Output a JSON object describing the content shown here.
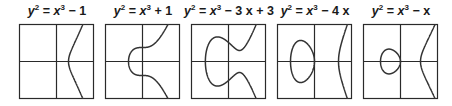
{
  "figure": {
    "panels": [
      {
        "id": "p1",
        "title_lhs": "y",
        "title_lhs_exp": "2",
        "title_eq": " = ",
        "title_x": "x",
        "title_x_exp": "3",
        "title_rest": " − 1",
        "box_left": 19
      },
      {
        "id": "p2",
        "title_lhs": "y",
        "title_lhs_exp": "2",
        "title_eq": " = ",
        "title_x": "x",
        "title_x_exp": "3",
        "title_rest": " + 1",
        "box_left": 105
      },
      {
        "id": "p3",
        "title_lhs": "y",
        "title_lhs_exp": "2",
        "title_eq": " = ",
        "title_x": "x",
        "title_x_exp": "3",
        "title_rest": " − 3 x + 3",
        "box_left": 191
      },
      {
        "id": "p4",
        "title_lhs": "y",
        "title_lhs_exp": "2",
        "title_eq": " = ",
        "title_x": "x",
        "title_x_exp": "3",
        "title_rest": " − 4 x",
        "box_left": 277
      },
      {
        "id": "p5",
        "title_lhs": "y",
        "title_lhs_exp": "2",
        "title_eq": " = ",
        "title_x": "x",
        "title_x_exp": "3",
        "title_rest": " − x",
        "box_left": 363
      }
    ]
  },
  "chart_data": [
    {
      "type": "line",
      "title": "y² = x³ − 1",
      "equation": "y^2 = x^3 - 1",
      "components": 1,
      "axes": "centered, no ticks",
      "grid": false
    },
    {
      "type": "line",
      "title": "y² = x³ + 1",
      "equation": "y^2 = x^3 + 1",
      "components": 1,
      "axes": "centered, no ticks",
      "grid": false
    },
    {
      "type": "line",
      "title": "y² = x³ − 3 x + 3",
      "equation": "y^2 = x^3 - 3x + 3",
      "components": 1,
      "axes": "centered, no ticks",
      "grid": false
    },
    {
      "type": "line",
      "title": "y² = x³ − 4 x",
      "equation": "y^2 = x^3 - 4x",
      "components": 2,
      "axes": "centered, no ticks",
      "grid": false
    },
    {
      "type": "line",
      "title": "y² = x³ − x",
      "equation": "y^2 = x^3 - x",
      "components": 2,
      "axes": "centered, no ticks",
      "grid": false
    }
  ]
}
